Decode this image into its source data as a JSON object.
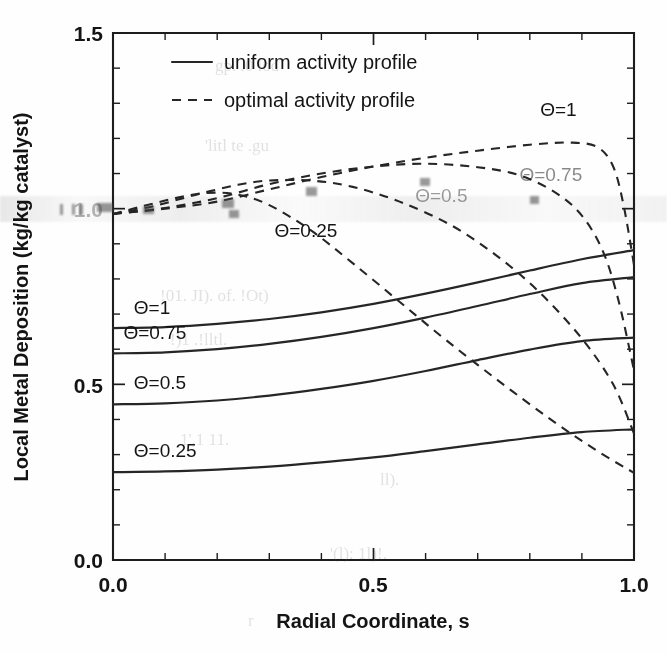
{
  "chart_data": {
    "type": "line",
    "title": "",
    "xlabel": "Radial Coordinate, s",
    "ylabel": "Local Metal Deposition (kg/kg catalyst)",
    "xlim": [
      0.0,
      1.0
    ],
    "ylim": [
      0.0,
      1.5
    ],
    "xticks": [
      "0.0",
      "0.5",
      "1.0"
    ],
    "xtick_values": [
      0.0,
      0.5,
      1.0
    ],
    "yticks": [
      "0.0",
      "0.5",
      "1.0",
      "1.5"
    ],
    "ytick_values": [
      0.0,
      0.5,
      1.0,
      1.5
    ],
    "minor_tick_step": 0.1,
    "grid": false,
    "legend_position": "upper-left-inside",
    "legend": [
      {
        "label": "uniform activity profile",
        "style": "solid"
      },
      {
        "label": "optimal activity profile",
        "style": "dashed"
      }
    ],
    "series": [
      {
        "name": "uniform, Θ=1",
        "style": "solid",
        "annotation": "Θ=1",
        "x": [
          0.0,
          0.1,
          0.2,
          0.3,
          0.4,
          0.5,
          0.6,
          0.7,
          0.8,
          0.9,
          1.0
        ],
        "y": [
          0.66,
          0.663,
          0.672,
          0.686,
          0.705,
          0.729,
          0.758,
          0.79,
          0.824,
          0.856,
          0.882
        ]
      },
      {
        "name": "uniform, Θ=0.75",
        "style": "solid",
        "annotation": "Θ=0.75",
        "x": [
          0.0,
          0.1,
          0.2,
          0.3,
          0.4,
          0.5,
          0.6,
          0.7,
          0.8,
          0.9,
          1.0
        ],
        "y": [
          0.588,
          0.591,
          0.6,
          0.615,
          0.635,
          0.66,
          0.69,
          0.723,
          0.757,
          0.788,
          0.805
        ]
      },
      {
        "name": "uniform, Θ=0.5",
        "style": "solid",
        "annotation": "Θ=0.5",
        "x": [
          0.0,
          0.1,
          0.2,
          0.3,
          0.4,
          0.5,
          0.6,
          0.7,
          0.8,
          0.9,
          1.0
        ],
        "y": [
          0.443,
          0.446,
          0.454,
          0.468,
          0.487,
          0.51,
          0.538,
          0.569,
          0.599,
          0.623,
          0.633
        ]
      },
      {
        "name": "uniform, Θ=0.25",
        "style": "solid",
        "annotation": "Θ=0.25",
        "x": [
          0.0,
          0.1,
          0.2,
          0.3,
          0.4,
          0.5,
          0.6,
          0.7,
          0.8,
          0.9,
          1.0
        ],
        "y": [
          0.25,
          0.252,
          0.257,
          0.266,
          0.278,
          0.292,
          0.31,
          0.329,
          0.348,
          0.364,
          0.372
        ]
      },
      {
        "name": "optimal, Θ=1",
        "style": "dashed",
        "annotation": "Θ=1",
        "x": [
          0.0,
          0.1,
          0.2,
          0.3,
          0.4,
          0.5,
          0.6,
          0.7,
          0.8,
          0.88,
          0.93,
          0.96,
          0.98,
          1.0
        ],
        "y": [
          0.985,
          1.0,
          1.02,
          1.055,
          1.09,
          1.12,
          1.145,
          1.165,
          1.182,
          1.188,
          1.175,
          1.12,
          1.01,
          0.84
        ]
      },
      {
        "name": "optimal, Θ=0.75",
        "style": "dashed",
        "annotation": "Θ=0.75",
        "x": [
          0.0,
          0.1,
          0.2,
          0.3,
          0.4,
          0.5,
          0.6,
          0.7,
          0.78,
          0.85,
          0.9,
          0.94,
          0.97,
          1.0
        ],
        "y": [
          0.985,
          1.002,
          1.03,
          1.07,
          1.1,
          1.12,
          1.128,
          1.118,
          1.095,
          1.045,
          0.98,
          0.88,
          0.74,
          0.54
        ]
      },
      {
        "name": "optimal, Θ=0.5",
        "style": "dashed",
        "annotation": "Θ=0.5",
        "x": [
          0.0,
          0.08,
          0.16,
          0.24,
          0.3,
          0.38,
          0.46,
          0.55,
          0.65,
          0.74,
          0.82,
          0.9,
          0.96,
          1.0
        ],
        "y": [
          0.985,
          1.008,
          1.04,
          1.068,
          1.08,
          1.08,
          1.062,
          1.02,
          0.952,
          0.862,
          0.76,
          0.63,
          0.5,
          0.36
        ]
      },
      {
        "name": "optimal, Θ=0.25",
        "style": "dashed",
        "annotation": "Θ=0.25",
        "x": [
          0.0,
          0.06,
          0.12,
          0.18,
          0.24,
          0.3,
          0.38,
          0.46,
          0.55,
          0.64,
          0.74,
          0.84,
          0.93,
          1.0
        ],
        "y": [
          0.985,
          1.008,
          1.03,
          1.045,
          1.04,
          1.01,
          0.938,
          0.845,
          0.735,
          0.625,
          0.51,
          0.4,
          0.31,
          0.248
        ]
      }
    ],
    "annotations": [
      {
        "text": "Θ=1",
        "x": 0.82,
        "y": 1.265,
        "series": "optimal, Θ=1"
      },
      {
        "text": "Θ=0.75",
        "x": 0.78,
        "y": 1.08,
        "series": "optimal, Θ=0.75"
      },
      {
        "text": "Θ=0.5",
        "x": 0.58,
        "y": 1.02,
        "series": "optimal, Θ=0.5"
      },
      {
        "text": "Θ=0.25",
        "x": 0.31,
        "y": 0.92,
        "series": "optimal, Θ=0.25"
      },
      {
        "text": "Θ=1",
        "x": 0.04,
        "y": 0.7,
        "series": "uniform, Θ=1"
      },
      {
        "text": "Θ=0.75",
        "x": 0.02,
        "y": 0.63,
        "series": "uniform, Θ=0.75"
      },
      {
        "text": "Θ=0.5",
        "x": 0.04,
        "y": 0.487,
        "series": "uniform, Θ=0.5"
      },
      {
        "text": "Θ=0.25",
        "x": 0.04,
        "y": 0.292,
        "series": "uniform, Θ=0.25"
      }
    ]
  },
  "axes": {
    "x_title": "Radial Coordinate, s",
    "y_title": "Local Metal Deposition (kg/kg catalyst)",
    "x_labels": [
      "0.0",
      "0.5",
      "1.0"
    ],
    "y_labels": [
      "1.5",
      "1.0",
      "0.5",
      "0.0"
    ]
  },
  "legend": {
    "uniform_label": "uniform activity profile",
    "optimal_label": "optimal activity profile"
  },
  "curve_labels": {
    "opt_t1": "Θ=1",
    "opt_t075": "Θ=0.75",
    "opt_t05": "Θ=0.5",
    "opt_t025": "Θ=0.25",
    "uni_t1": "Θ=1",
    "uni_t075": "Θ=0.75",
    "uni_t05": "Θ=0.5",
    "uni_t025": "Θ=0.25"
  }
}
